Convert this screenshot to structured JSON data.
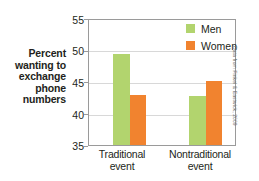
{
  "axis_title": "Percent\nwanting to\nexchange\nphone\nnumbers",
  "axis_title_lines": [
    "Percent",
    "wanting to",
    "exchange",
    "phone",
    "numbers"
  ],
  "credit": "Data from Finkel & Eastwick, 2009",
  "legend": {
    "position": "top-right",
    "items": [
      {
        "label": "Men",
        "color": "#b2d46e"
      },
      {
        "label": "Women",
        "color": "#f1832f"
      }
    ]
  },
  "ticks": {
    "y": [
      "55",
      "50",
      "45",
      "40",
      "35"
    ]
  },
  "categories_display": [
    {
      "line1": "Traditional",
      "line2": "event"
    },
    {
      "line1": "Nontraditional",
      "line2": "event"
    }
  ],
  "chart_data": {
    "type": "bar",
    "title": "",
    "subtitle": "",
    "xlabel": "",
    "ylabel": "Percent wanting to exchange phone numbers",
    "categories": [
      "Traditional event",
      "Nontraditional event"
    ],
    "series": [
      {
        "name": "Men",
        "color": "#b2d46e",
        "values": [
          49.4,
          42.8
        ]
      },
      {
        "name": "Women",
        "color": "#f1832f",
        "values": [
          43.0,
          45.1
        ]
      }
    ],
    "ylim": [
      35,
      55
    ],
    "ytick_values": [
      35,
      40,
      45,
      50,
      55
    ],
    "grid": true,
    "grid_axis": "y",
    "legend_position": "top-right",
    "source_note": "Data from Finkel & Eastwick, 2009"
  }
}
